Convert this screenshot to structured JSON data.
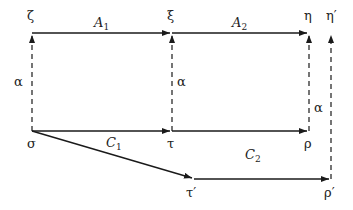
{
  "diagram": {
    "nodes": {
      "zeta": {
        "label": "ζ",
        "x": 32,
        "y": 33
      },
      "xi": {
        "label": "ξ",
        "x": 172,
        "y": 33
      },
      "eta": {
        "label": "η",
        "x": 309,
        "y": 33
      },
      "eta_prime": {
        "label": "η′",
        "x": 331,
        "y": 33
      },
      "sigma": {
        "label": "σ",
        "x": 32,
        "y": 131
      },
      "tau": {
        "label": "τ",
        "x": 172,
        "y": 131
      },
      "rho": {
        "label": "ρ",
        "x": 309,
        "y": 131
      },
      "tau_prime": {
        "label": "τ′",
        "x": 194,
        "y": 179
      },
      "rho_prime": {
        "label": "ρ′",
        "x": 331,
        "y": 179
      }
    },
    "edges": {
      "A1": {
        "base": "A",
        "sub": "1",
        "from": "ζ",
        "to": "ξ",
        "style": "solid"
      },
      "A2": {
        "base": "A",
        "sub": "2",
        "from": "ξ",
        "to": "η",
        "style": "solid"
      },
      "C1": {
        "base": "C",
        "sub": "1",
        "from": "σ",
        "to": "τ",
        "style": "solid"
      },
      "C2": {
        "base": "C",
        "sub": "2",
        "from": "τ′",
        "to": "ρ′",
        "style": "solid"
      },
      "alpha_left": {
        "label": "α",
        "from": "σ",
        "to": "ζ",
        "style": "dashed"
      },
      "alpha_mid": {
        "label": "α",
        "from": "τ",
        "to": "ξ",
        "style": "dashed"
      },
      "alpha_right": {
        "label": "α",
        "from": "ρ",
        "to": "η",
        "style": "dashed"
      },
      "alpha_prime": {
        "label": "",
        "from": "ρ′",
        "to": "η′",
        "style": "dashed"
      },
      "tau_to_rho": {
        "label": "",
        "from": "τ",
        "to": "ρ",
        "style": "solid"
      },
      "sigma_to_tau_prime": {
        "label": "",
        "from": "σ",
        "to": "τ′",
        "style": "solid"
      }
    },
    "stroke_color": "#1a1a1a"
  }
}
